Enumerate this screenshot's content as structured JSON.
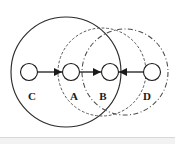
{
  "figure": {
    "kind": "node-and-region-diagram",
    "width": 175,
    "height": 144,
    "background": "#ffffff",
    "ink_color": "#1a1a1a"
  },
  "nodes": [
    {
      "id": "C",
      "label": "C",
      "cx": 29,
      "cy": 72,
      "r": 8.5,
      "label_x": 32,
      "label_y": 100
    },
    {
      "id": "A",
      "label": "A",
      "cx": 71,
      "cy": 72,
      "r": 8.5,
      "label_x": 74,
      "label_y": 100
    },
    {
      "id": "B",
      "label": "B",
      "cx": 110,
      "cy": 72,
      "r": 8.5,
      "label_x": 103,
      "label_y": 100
    },
    {
      "id": "D",
      "label": "D",
      "cx": 152,
      "cy": 72,
      "r": 8.5,
      "label_x": 147,
      "label_y": 100
    }
  ],
  "edges": [
    {
      "from": "C",
      "to": "A",
      "direction": "right",
      "x1": 38,
      "x2": 62,
      "y": 72
    },
    {
      "from": "A",
      "to": "B",
      "direction": "right",
      "x1": 80,
      "x2": 101,
      "y": 72
    },
    {
      "from": "D",
      "to": "B",
      "direction": "left",
      "x1": 143,
      "x2": 119,
      "y": 72
    }
  ],
  "regions": [
    {
      "id": "region-solid",
      "style": "solid",
      "cx": 66,
      "cy": 72,
      "r": 55,
      "color": "#2b2b2b"
    },
    {
      "id": "region-dotted",
      "style": "dotted",
      "cx": 102,
      "cy": 72,
      "r": 44,
      "color": "#5a5a5a"
    },
    {
      "id": "region-dashdot",
      "style": "dash-dot",
      "cx": 125,
      "cy": 72,
      "r": 43,
      "color": "#4a4a4a"
    }
  ]
}
